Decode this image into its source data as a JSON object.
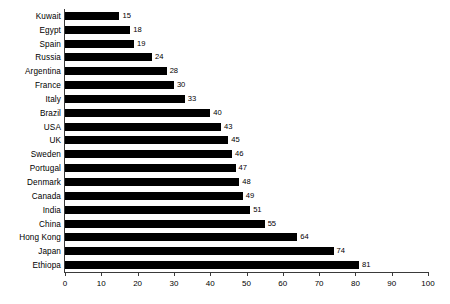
{
  "chart_data": {
    "type": "bar",
    "orientation": "horizontal",
    "title": "",
    "subtitle": "",
    "xlabel": "",
    "ylabel": "",
    "xlim": [
      0,
      100
    ],
    "xticks": [
      0,
      10,
      20,
      30,
      40,
      50,
      60,
      70,
      80,
      90,
      100
    ],
    "grid": false,
    "legend": false,
    "bar_color": "#000000",
    "background_color": "#ffffff",
    "axis_color": "#3a3a3a",
    "data_labels_shown": true,
    "categories": [
      "Kuwait",
      "Egypt",
      "Spain",
      "Russia",
      "Argentina",
      "France",
      "Italy",
      "Brazil",
      "USA",
      "UK",
      "Sweden",
      "Portugal",
      "Denmark",
      "Canada",
      "India",
      "China",
      "Hong Kong",
      "Japan",
      "Ethiopa"
    ],
    "values": [
      15,
      18,
      19,
      24,
      28,
      30,
      33,
      40,
      43,
      45,
      46,
      47,
      48,
      49,
      51,
      55,
      64,
      74,
      81
    ],
    "value_labels": [
      "15",
      "18",
      "19",
      "24",
      "28",
      "30",
      "33",
      "40",
      "43",
      "45",
      "46",
      "47",
      "48",
      "49",
      "51",
      "55",
      "64",
      "74",
      "81"
    ],
    "xtick_labels": [
      "0",
      "10",
      "20",
      "30",
      "40",
      "50",
      "60",
      "70",
      "80",
      "90",
      "100"
    ]
  }
}
